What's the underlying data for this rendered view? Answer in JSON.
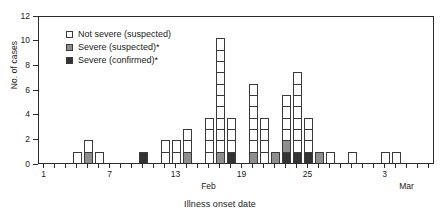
{
  "chart_data": {
    "type": "bar",
    "title": "",
    "xlabel": "Illness onset date",
    "ylabel": "No. of cases",
    "ylim": [
      0,
      12
    ],
    "ytick_values": [
      0,
      2,
      4,
      6,
      8,
      10,
      12
    ],
    "ytick_labels": [
      "0",
      "2",
      "4",
      "6",
      "8",
      "10",
      "12"
    ],
    "grid": false,
    "stacked": true,
    "legend_position": "upper-left-inside",
    "x_axis_note": "Daily illness onset; tick marks every day, labels every 6 days",
    "xtick_labels": [
      {
        "day_index": 1,
        "label": "1"
      },
      {
        "day_index": 7,
        "label": "7"
      },
      {
        "day_index": 13,
        "label": "13"
      },
      {
        "day_index": 19,
        "label": "19"
      },
      {
        "day_index": 25,
        "label": "25"
      },
      {
        "day_index": 32,
        "label": "3"
      }
    ],
    "month_labels": [
      {
        "day_index": 16,
        "label": "Feb"
      },
      {
        "day_index": 34,
        "label": "Mar"
      }
    ],
    "series": [
      {
        "name": "Not severe (suspected)",
        "color": "#ffffff",
        "key": "notsevere"
      },
      {
        "name": "Severe (suspected)*",
        "color": "#8e8e8e",
        "key": "suspected"
      },
      {
        "name": "Severe (confirmed)*",
        "color": "#333333",
        "key": "confirmed"
      }
    ],
    "categories": [
      "1",
      "2",
      "3",
      "4",
      "5",
      "6",
      "7",
      "8",
      "9",
      "10",
      "11",
      "12",
      "13",
      "14",
      "15",
      "16",
      "17",
      "18",
      "19",
      "20",
      "21",
      "22",
      "23",
      "24",
      "25",
      "26",
      "27",
      "28",
      "29",
      "30",
      "31",
      "32",
      "33",
      "34",
      "35",
      "36"
    ],
    "bars": [
      {
        "day": 1,
        "notsevere": 0,
        "suspected": 0,
        "confirmed": 0,
        "total": 0
      },
      {
        "day": 2,
        "notsevere": 0,
        "suspected": 0,
        "confirmed": 0,
        "total": 0
      },
      {
        "day": 3,
        "notsevere": 0,
        "suspected": 0,
        "confirmed": 0,
        "total": 0
      },
      {
        "day": 4,
        "notsevere": 1,
        "suspected": 0,
        "confirmed": 0,
        "total": 1
      },
      {
        "day": 5,
        "notsevere": 1,
        "suspected": 1,
        "confirmed": 0,
        "total": 2
      },
      {
        "day": 6,
        "notsevere": 1,
        "suspected": 0,
        "confirmed": 0,
        "total": 1
      },
      {
        "day": 7,
        "notsevere": 0,
        "suspected": 0,
        "confirmed": 0,
        "total": 0
      },
      {
        "day": 8,
        "notsevere": 0,
        "suspected": 0,
        "confirmed": 0,
        "total": 0
      },
      {
        "day": 9,
        "notsevere": 0,
        "suspected": 0,
        "confirmed": 0,
        "total": 0
      },
      {
        "day": 10,
        "notsevere": 0,
        "suspected": 0,
        "confirmed": 1,
        "total": 1
      },
      {
        "day": 11,
        "notsevere": 0,
        "suspected": 0,
        "confirmed": 0,
        "total": 0
      },
      {
        "day": 12,
        "notsevere": 2,
        "suspected": 0,
        "confirmed": 0,
        "total": 2
      },
      {
        "day": 13,
        "notsevere": 2,
        "suspected": 0,
        "confirmed": 0,
        "total": 2
      },
      {
        "day": 14,
        "notsevere": 2,
        "suspected": 1,
        "confirmed": 0,
        "total": 3
      },
      {
        "day": 15,
        "notsevere": 0,
        "suspected": 0,
        "confirmed": 0,
        "total": 0
      },
      {
        "day": 16,
        "notsevere": 4,
        "suspected": 0,
        "confirmed": 0,
        "total": 4
      },
      {
        "day": 17,
        "notsevere": 10,
        "suspected": 1,
        "confirmed": 0,
        "total": 11
      },
      {
        "day": 18,
        "notsevere": 3,
        "suspected": 0,
        "confirmed": 1,
        "total": 4
      },
      {
        "day": 19,
        "notsevere": 0,
        "suspected": 0,
        "confirmed": 0,
        "total": 0
      },
      {
        "day": 20,
        "notsevere": 6,
        "suspected": 1,
        "confirmed": 0,
        "total": 7
      },
      {
        "day": 21,
        "notsevere": 4,
        "suspected": 0,
        "confirmed": 0,
        "total": 4
      },
      {
        "day": 22,
        "notsevere": 0,
        "suspected": 1,
        "confirmed": 0,
        "total": 1
      },
      {
        "day": 23,
        "notsevere": 4,
        "suspected": 1,
        "confirmed": 1,
        "total": 6
      },
      {
        "day": 24,
        "notsevere": 7,
        "suspected": 0,
        "confirmed": 1,
        "total": 8
      },
      {
        "day": 25,
        "notsevere": 3,
        "suspected": 0,
        "confirmed": 1,
        "total": 4
      },
      {
        "day": 26,
        "notsevere": 0,
        "suspected": 1,
        "confirmed": 0,
        "total": 1
      },
      {
        "day": 27,
        "notsevere": 1,
        "suspected": 0,
        "confirmed": 0,
        "total": 1
      },
      {
        "day": 28,
        "notsevere": 0,
        "suspected": 0,
        "confirmed": 0,
        "total": 0
      },
      {
        "day": 29,
        "notsevere": 1,
        "suspected": 0,
        "confirmed": 0,
        "total": 1
      },
      {
        "day": 30,
        "notsevere": 0,
        "suspected": 0,
        "confirmed": 0,
        "total": 0
      },
      {
        "day": 31,
        "notsevere": 0,
        "suspected": 0,
        "confirmed": 0,
        "total": 0
      },
      {
        "day": 32,
        "notsevere": 1,
        "suspected": 0,
        "confirmed": 0,
        "total": 1
      },
      {
        "day": 33,
        "notsevere": 1,
        "suspected": 0,
        "confirmed": 0,
        "total": 1
      },
      {
        "day": 34,
        "notsevere": 0,
        "suspected": 0,
        "confirmed": 0,
        "total": 0
      },
      {
        "day": 35,
        "notsevere": 0,
        "suspected": 0,
        "confirmed": 0,
        "total": 0
      },
      {
        "day": 36,
        "notsevere": 0,
        "suspected": 0,
        "confirmed": 0,
        "total": 0
      }
    ]
  },
  "legend": {
    "items": [
      {
        "label": "Not severe (suspected)",
        "key": "notsevere"
      },
      {
        "label": "Severe (suspected)*",
        "key": "suspected"
      },
      {
        "label": "Severe (confirmed)*",
        "key": "confirmed"
      }
    ]
  },
  "axes": {
    "y_title": "No. of cases",
    "x_title": "Illness onset date"
  }
}
